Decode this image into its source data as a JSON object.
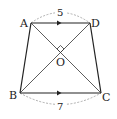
{
  "figure": {
    "type": "trapezoid",
    "colors": {
      "stroke": "#222222",
      "dashed": "#999999",
      "background": "#ffffff"
    },
    "vertices": {
      "A": {
        "label": "A",
        "x": 31,
        "y": 23
      },
      "D": {
        "label": "D",
        "x": 90,
        "y": 23
      },
      "B": {
        "label": "B",
        "x": 20,
        "y": 93
      },
      "C": {
        "label": "C",
        "x": 101,
        "y": 93
      },
      "O": {
        "label": "O",
        "x": 60.5,
        "y": 52.5
      }
    },
    "measurements": {
      "top": "5",
      "bottom": "7"
    },
    "annotations": {
      "parallel_marks": [
        "AD",
        "BC"
      ],
      "right_angle_at": "O",
      "diagonals": [
        "AC",
        "BD"
      ]
    }
  }
}
